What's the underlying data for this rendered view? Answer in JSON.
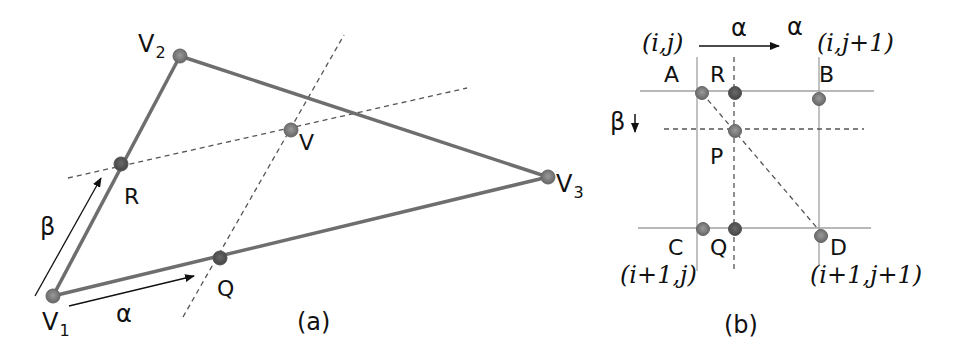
{
  "panel_a": {
    "caption": "(a)",
    "vertices": {
      "v1": {
        "label": "V",
        "sub": "1"
      },
      "v2": {
        "label": "V",
        "sub": "2"
      },
      "v3": {
        "label": "V",
        "sub": "3"
      }
    },
    "points": {
      "r": "R",
      "q": "Q",
      "v": "V"
    },
    "arrows": {
      "beta": "β",
      "alpha": "α"
    }
  },
  "panel_b": {
    "caption": "(b)",
    "corner_indices": {
      "top_left": "(i,j)",
      "top_right": "(i,j+1)",
      "bottom_left": "(i+1,j)",
      "bottom_right": "(i+1,j+1)"
    },
    "points": {
      "a": "A",
      "r": "R",
      "b": "B",
      "p": "P",
      "c": "C",
      "q": "Q",
      "d": "D"
    },
    "arrows": {
      "alpha": "α",
      "alpha_end": "α",
      "beta": "β"
    }
  },
  "colors": {
    "edge": "#6e6e6e",
    "grid": "#a0a0a0",
    "dashed": "#555555",
    "node_fill": "#8a8a8a",
    "node_dark": "#555555",
    "text": "#111111"
  }
}
